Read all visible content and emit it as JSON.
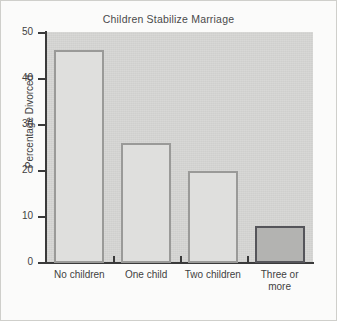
{
  "figure": {
    "title": "Children Stabilize Marriage",
    "background_color": "#fbfbfa",
    "plot_background_color": "#d6d6d4",
    "border_color": "#cfcfcb"
  },
  "axes": {
    "y_label": "Percentage Divorced",
    "y_ticks": [
      "0",
      "10",
      "20",
      "30",
      "40",
      "50"
    ],
    "x_label": ""
  },
  "chart_data": {
    "type": "bar",
    "title": "Children Stabilize Marriage",
    "xlabel": "",
    "ylabel": "Percentage Divorced",
    "ylim": [
      0,
      50
    ],
    "yticks": [
      0,
      10,
      20,
      30,
      40,
      50
    ],
    "grid": false,
    "legend": "none",
    "categories": [
      "No children",
      "One child",
      "Two children",
      "Three or more"
    ],
    "category_lines": [
      [
        "No children"
      ],
      [
        "One child"
      ],
      [
        "Two children"
      ],
      [
        "Three or",
        "more"
      ]
    ],
    "values": [
      46,
      26,
      20,
      8
    ],
    "bar_styles": [
      {
        "fill": "#dfdfdd",
        "edge": "#9a9a98"
      },
      {
        "fill": "#dfdfdd",
        "edge": "#9a9a98"
      },
      {
        "fill": "#dfdfdd",
        "edge": "#9a9a98"
      },
      {
        "fill": "#b3b3b1",
        "edge": "#55555a"
      }
    ]
  }
}
